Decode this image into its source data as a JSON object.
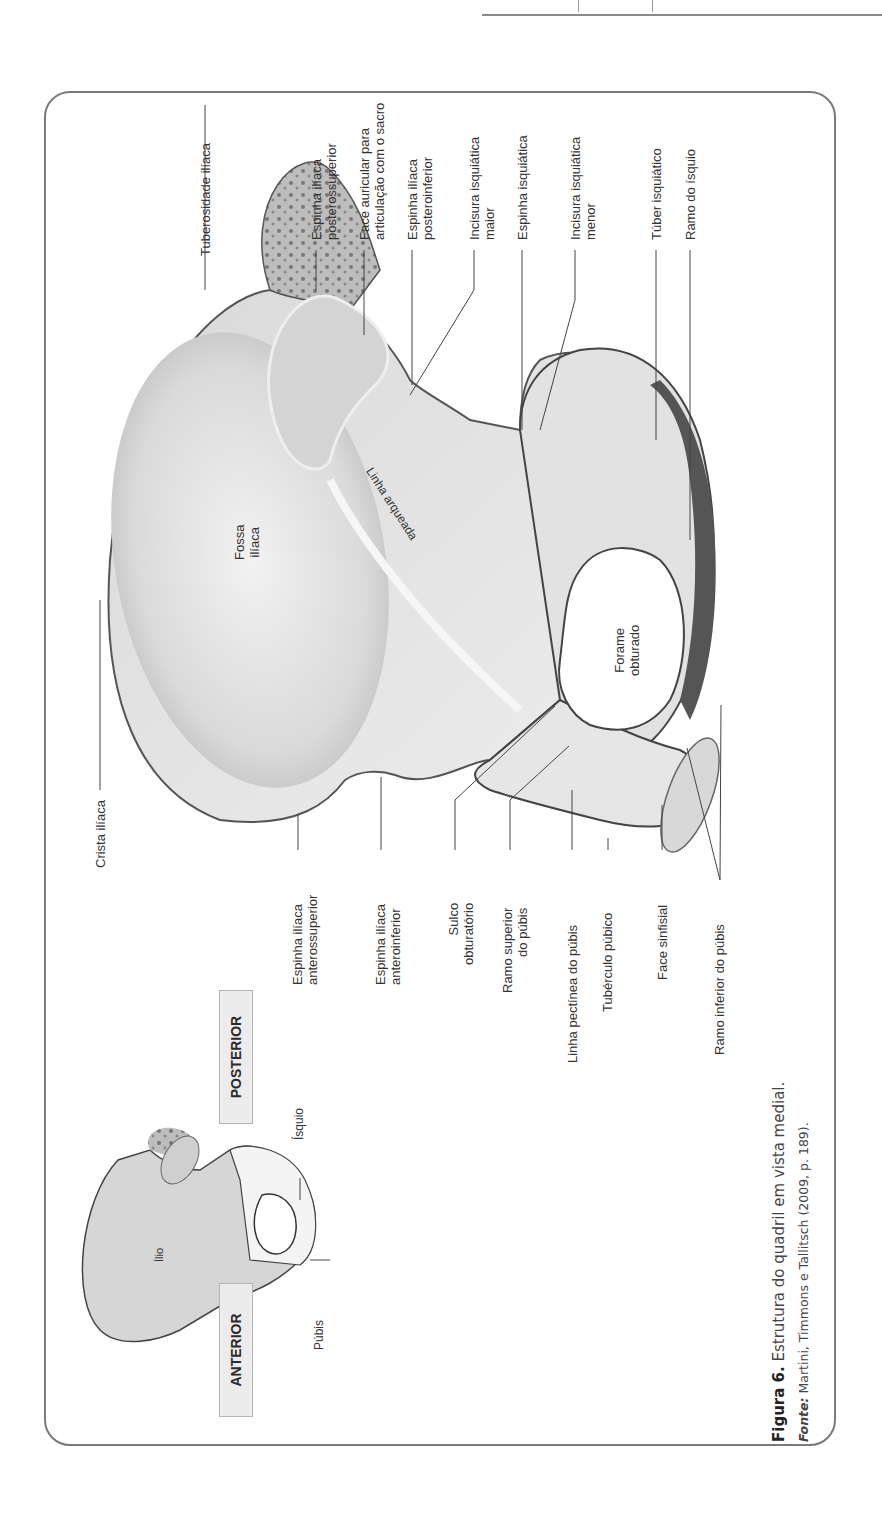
{
  "page": {
    "orientation": "rotated-90-ccw"
  },
  "figure": {
    "main_labels_top": [
      {
        "id": "tuberosidade-iliaca",
        "lines": [
          "Tuberosidade ilíaca"
        ]
      },
      {
        "id": "espinha-iliaca-posterossuperior",
        "lines": [
          "Espinha ilíaca",
          "posterossuperior"
        ]
      },
      {
        "id": "face-auricular",
        "lines": [
          "Face auricular para",
          "articulação com o sacro"
        ]
      },
      {
        "id": "espinha-iliaca-posteroinferior",
        "lines": [
          "Espinha ilíaca",
          "posteroinferior"
        ]
      },
      {
        "id": "incisura-isquiatica-maior",
        "lines": [
          "Incisura isquiática",
          "maior"
        ]
      },
      {
        "id": "espinha-isquiatica",
        "lines": [
          "Espinha isquiática"
        ]
      },
      {
        "id": "incisura-isquiatica-menor",
        "lines": [
          "Incisura isquiática",
          "menor"
        ]
      },
      {
        "id": "tuber-isquiatico",
        "lines": [
          "Túber isquiático"
        ]
      },
      {
        "id": "ramo-do-isquio",
        "lines": [
          "Ramo do ísquio"
        ]
      }
    ],
    "main_labels_bottom": [
      {
        "id": "crista-iliaca",
        "lines": [
          "Crista ilíaca"
        ]
      },
      {
        "id": "espinha-iliaca-anterossuperior",
        "lines": [
          "Espinha ilíaca",
          "anterossuperior"
        ]
      },
      {
        "id": "espinha-iliaca-anteroinferior",
        "lines": [
          "Espinha ilíaca",
          "anteroinferior"
        ]
      },
      {
        "id": "sulco-obturatorio",
        "lines": [
          "Sulco",
          "obturatório"
        ]
      },
      {
        "id": "ramo-superior-do-pubis",
        "lines": [
          "Ramo superior",
          "do púbis"
        ]
      },
      {
        "id": "linha-pectinea-do-pubis",
        "lines": [
          "Linha pectínea do púbis"
        ]
      },
      {
        "id": "tuberculo-pubico",
        "lines": [
          "Tubérculo púbico"
        ]
      },
      {
        "id": "face-sinfisial",
        "lines": [
          "Face sinfisial"
        ]
      },
      {
        "id": "ramo-inferior-do-pubis",
        "lines": [
          "Ramo inferior do púbis"
        ]
      }
    ],
    "inner_labels": {
      "fossa_iliaca": [
        "Fossa",
        "ilíaca"
      ],
      "linha_arqueada": "Linha arqueada",
      "forame_obturado": [
        "Forame",
        "obturado"
      ]
    },
    "inset": {
      "anterior": "ANTERIOR",
      "posterior": "POSTERIOR",
      "ilio": "Ílio",
      "isquio": "Ísquio",
      "pubis": "Púbis"
    },
    "caption": {
      "figure_number": "Figura 6.",
      "title": "Estrutura do quadril em vista medial.",
      "source_label": "Fonte:",
      "source_text": "Martini, Timmons e Tallitsch (2009, p. 189)."
    }
  }
}
